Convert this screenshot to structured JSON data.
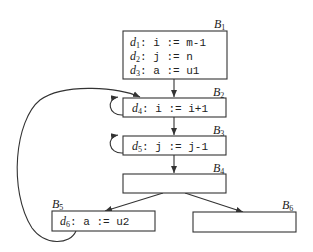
{
  "diagram": {
    "type": "control-flow-graph",
    "blocks": [
      {
        "id": "B1",
        "label": "B",
        "sub": "1",
        "statements": [
          {
            "def": "d",
            "sub": "1",
            "code": ": i := m-1"
          },
          {
            "def": "d",
            "sub": "2",
            "code": ": j := n"
          },
          {
            "def": "d",
            "sub": "3",
            "code": ": a := u1"
          }
        ]
      },
      {
        "id": "B2",
        "label": "B",
        "sub": "2",
        "statements": [
          {
            "def": "d",
            "sub": "4",
            "code": ": i := i+1"
          }
        ]
      },
      {
        "id": "B3",
        "label": "B",
        "sub": "3",
        "statements": [
          {
            "def": "d",
            "sub": "5",
            "code": ": j := j-1"
          }
        ]
      },
      {
        "id": "B4",
        "label": "B",
        "sub": "4",
        "statements": []
      },
      {
        "id": "B5",
        "label": "B",
        "sub": "5",
        "statements": [
          {
            "def": "d",
            "sub": "6",
            "code": ": a := u2"
          }
        ]
      },
      {
        "id": "B6",
        "label": "B",
        "sub": "6",
        "statements": []
      }
    ],
    "edges": [
      {
        "from": "B1",
        "to": "B2"
      },
      {
        "from": "B2",
        "to": "B3"
      },
      {
        "from": "B3",
        "to": "B4"
      },
      {
        "from": "B4",
        "to": "B5"
      },
      {
        "from": "B4",
        "to": "B6"
      },
      {
        "from": "B2",
        "to": "B2",
        "kind": "self-loop"
      },
      {
        "from": "B3",
        "to": "B3",
        "kind": "self-loop"
      },
      {
        "from": "B5",
        "to": "B2",
        "kind": "back-edge"
      }
    ]
  }
}
